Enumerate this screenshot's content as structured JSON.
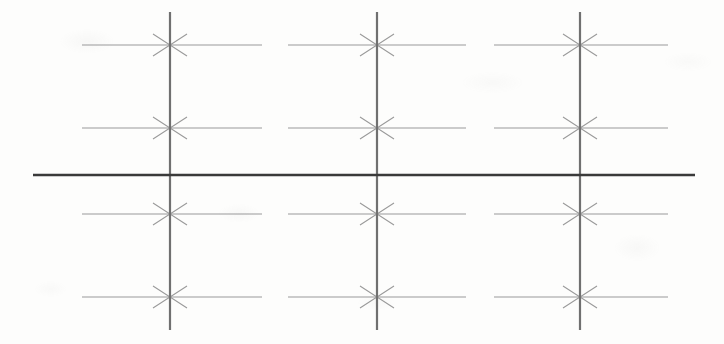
{
  "document": {
    "kind": "scanned-line-drawing",
    "title": "Dimension grid line drawing",
    "width": 724,
    "height": 344,
    "background_color": "#fdfdfc"
  },
  "colors": {
    "thin_line": "#9a9a9a",
    "vertical_line": "#707070",
    "datum_line": "#3a3a3a",
    "paper": "#fdfdfc"
  },
  "strokes": {
    "thin_line_width": 1.1,
    "vertical_line_width": 2.2,
    "datum_line_width": 2.4,
    "arrow_head_length": 17,
    "arrow_head_spread": 11
  },
  "vertical_lines": [
    {
      "name": "vertical-line-1",
      "x": 170,
      "y_top": 12,
      "y_bottom": 330
    },
    {
      "name": "vertical-line-2",
      "x": 377,
      "y_top": 12,
      "y_bottom": 330
    },
    {
      "name": "vertical-line-3",
      "x": 580,
      "y_top": 12,
      "y_bottom": 330
    }
  ],
  "datum_line": {
    "name": "horizontal-datum-line",
    "y": 175,
    "x_start": 33,
    "x_end": 695
  },
  "arrow_rows": [
    {
      "name": "arrow-row-1",
      "y": 45
    },
    {
      "name": "arrow-row-2",
      "y": 128
    },
    {
      "name": "arrow-row-3",
      "y": 214
    },
    {
      "name": "arrow-row-4",
      "y": 297
    }
  ],
  "dimension_segments": [
    {
      "name": "segment-left-of-v1",
      "row": 0,
      "x_start": 82,
      "x_end": 170,
      "arrow_at": "end",
      "target": 170
    },
    {
      "name": "segment-right-of-v1",
      "row": 0,
      "x_start": 170,
      "x_end": 262,
      "arrow_at": "start",
      "target": 170
    },
    {
      "name": "segment-left-of-v2",
      "row": 0,
      "x_start": 288,
      "x_end": 377,
      "arrow_at": "end",
      "target": 377
    },
    {
      "name": "segment-right-of-v2",
      "row": 0,
      "x_start": 377,
      "x_end": 466,
      "arrow_at": "start",
      "target": 377
    },
    {
      "name": "segment-left-of-v3",
      "row": 0,
      "x_start": 494,
      "x_end": 580,
      "arrow_at": "end",
      "target": 580
    },
    {
      "name": "segment-right-of-v3",
      "row": 0,
      "x_start": 580,
      "x_end": 668,
      "arrow_at": "start",
      "target": 580
    },
    {
      "name": "segment-left-of-v1",
      "row": 1,
      "x_start": 82,
      "x_end": 170,
      "arrow_at": "end",
      "target": 170
    },
    {
      "name": "segment-right-of-v1",
      "row": 1,
      "x_start": 170,
      "x_end": 262,
      "arrow_at": "start",
      "target": 170
    },
    {
      "name": "segment-left-of-v2",
      "row": 1,
      "x_start": 288,
      "x_end": 377,
      "arrow_at": "end",
      "target": 377
    },
    {
      "name": "segment-right-of-v2",
      "row": 1,
      "x_start": 377,
      "x_end": 466,
      "arrow_at": "start",
      "target": 377
    },
    {
      "name": "segment-left-of-v3",
      "row": 1,
      "x_start": 494,
      "x_end": 580,
      "arrow_at": "end",
      "target": 580
    },
    {
      "name": "segment-right-of-v3",
      "row": 1,
      "x_start": 580,
      "x_end": 668,
      "arrow_at": "start",
      "target": 580
    },
    {
      "name": "segment-left-of-v1",
      "row": 2,
      "x_start": 82,
      "x_end": 170,
      "arrow_at": "end",
      "target": 170
    },
    {
      "name": "segment-right-of-v1",
      "row": 2,
      "x_start": 170,
      "x_end": 262,
      "arrow_at": "start",
      "target": 170
    },
    {
      "name": "segment-left-of-v2",
      "row": 2,
      "x_start": 288,
      "x_end": 377,
      "arrow_at": "end",
      "target": 377
    },
    {
      "name": "segment-right-of-v2",
      "row": 2,
      "x_start": 377,
      "x_end": 466,
      "arrow_at": "start",
      "target": 377
    },
    {
      "name": "segment-left-of-v3",
      "row": 2,
      "x_start": 494,
      "x_end": 580,
      "arrow_at": "end",
      "target": 580
    },
    {
      "name": "segment-right-of-v3",
      "row": 2,
      "x_start": 580,
      "x_end": 668,
      "arrow_at": "start",
      "target": 580
    },
    {
      "name": "segment-left-of-v1",
      "row": 3,
      "x_start": 82,
      "x_end": 170,
      "arrow_at": "end",
      "target": 170
    },
    {
      "name": "segment-right-of-v1",
      "row": 3,
      "x_start": 170,
      "x_end": 262,
      "arrow_at": "start",
      "target": 170
    },
    {
      "name": "segment-left-of-v2",
      "row": 3,
      "x_start": 288,
      "x_end": 377,
      "arrow_at": "end",
      "target": 377
    },
    {
      "name": "segment-right-of-v2",
      "row": 3,
      "x_start": 377,
      "x_end": 466,
      "arrow_at": "start",
      "target": 377
    },
    {
      "name": "segment-left-of-v3",
      "row": 3,
      "x_start": 494,
      "x_end": 580,
      "arrow_at": "end",
      "target": 580
    },
    {
      "name": "segment-right-of-v3",
      "row": 3,
      "x_start": 580,
      "x_end": 668,
      "arrow_at": "start",
      "target": 580
    }
  ],
  "labels": {
    "text_items": []
  }
}
